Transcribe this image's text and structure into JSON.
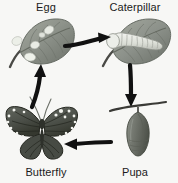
{
  "diagram": {
    "background_color": "#f7f7f5",
    "label_color": "#1b1b1b",
    "stages": [
      {
        "id": "egg",
        "label": "Egg",
        "position": "top-left",
        "illustration": "leaf-with-eggs",
        "description": "Gray-green leaf with several white egg clusters on its surface",
        "colors": {
          "leaf_body": "#8f948c",
          "leaf_shadow": "#6e736b",
          "leaf_highlight": "#a9ada3",
          "stem": "#4a4a46",
          "egg": "#eceee8"
        }
      },
      {
        "id": "caterpillar",
        "label": "Caterpillar",
        "position": "top-right",
        "illustration": "caterpillar-on-leaf",
        "description": "Pale segmented caterpillar resting on a gray-green leaf",
        "colors": {
          "leaf_body": "#8f948c",
          "leaf_shadow": "#6e736b",
          "leaf_highlight": "#a9ada3",
          "stem": "#4a4a46",
          "body": "#e3e5df",
          "segment_line": "#9a9c94"
        }
      },
      {
        "id": "pupa",
        "label": "Pupa",
        "position": "bottom-right",
        "illustration": "chrysalis-on-twig",
        "description": "Chrysalis hanging downward from a thin horizontal twig",
        "colors": {
          "twig": "#3a3a36",
          "body": "#6f736b",
          "body_shadow": "#54584f",
          "body_highlight": "#8d9189"
        }
      },
      {
        "id": "butterfly",
        "label": "Butterfly",
        "position": "bottom-left",
        "illustration": "butterfly-wings-spread",
        "description": "Dark butterfly with wings spread, white spots along wing margins and two antennae",
        "colors": {
          "wing": "#5a5e57",
          "wing_dark": "#3b3e38",
          "vein": "#24261f",
          "spot": "#f2f3ee",
          "body": "#2e312b",
          "antenna": "#5f635c"
        }
      }
    ],
    "arrows": [
      {
        "id": "egg-to-caterpillar",
        "from": "egg",
        "to": "caterpillar",
        "direction": "right",
        "position": "top",
        "color": "#111111"
      },
      {
        "id": "caterpillar-to-pupa",
        "from": "caterpillar",
        "to": "pupa",
        "direction": "down",
        "position": "right",
        "color": "#111111"
      },
      {
        "id": "pupa-to-butterfly",
        "from": "pupa",
        "to": "butterfly",
        "direction": "left",
        "position": "bottom",
        "color": "#111111"
      },
      {
        "id": "butterfly-to-egg",
        "from": "butterfly",
        "to": "egg",
        "direction": "up",
        "position": "left",
        "color": "#111111"
      }
    ]
  }
}
